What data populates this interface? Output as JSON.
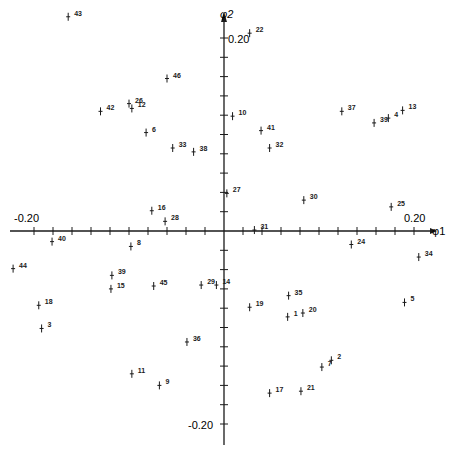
{
  "chart_data": {
    "type": "scatter",
    "title": "",
    "xlabel": "φ1",
    "ylabel": "φ2",
    "xlim": [
      -0.22,
      0.22
    ],
    "ylim": [
      -0.22,
      0.22
    ],
    "tick_step": 0.02,
    "tick_labels": {
      "x_neg": "-0.20",
      "x_pos": "0.20",
      "y_pos": "0.20",
      "y_neg": "-0.20"
    },
    "grid": false,
    "legend": null,
    "points": [
      {
        "label": "43",
        "x": -0.164,
        "y": 0.222
      },
      {
        "label": "22",
        "x": 0.027,
        "y": 0.205
      },
      {
        "label": "46",
        "x": -0.06,
        "y": 0.158
      },
      {
        "label": "26",
        "x": -0.1,
        "y": 0.132
      },
      {
        "label": "12",
        "x": -0.097,
        "y": 0.127
      },
      {
        "label": "42",
        "x": -0.13,
        "y": 0.124
      },
      {
        "label": "6",
        "x": -0.082,
        "y": 0.102
      },
      {
        "label": "33",
        "x": -0.054,
        "y": 0.086
      },
      {
        "label": "38",
        "x": -0.032,
        "y": 0.082
      },
      {
        "label": "10",
        "x": 0.009,
        "y": 0.119
      },
      {
        "label": "41",
        "x": 0.039,
        "y": 0.104
      },
      {
        "label": "32",
        "x": 0.048,
        "y": 0.086
      },
      {
        "label": "37",
        "x": 0.124,
        "y": 0.124
      },
      {
        "label": "39",
        "x": 0.158,
        "y": 0.112
      },
      {
        "label": "4",
        "x": 0.173,
        "y": 0.117
      },
      {
        "label": "13",
        "x": 0.188,
        "y": 0.125
      },
      {
        "label": "27",
        "x": 0.003,
        "y": 0.039
      },
      {
        "label": "30",
        "x": 0.084,
        "y": 0.032
      },
      {
        "label": "25",
        "x": 0.176,
        "y": 0.025
      },
      {
        "label": "16",
        "x": -0.076,
        "y": 0.021
      },
      {
        "label": "28",
        "x": -0.062,
        "y": 0.01
      },
      {
        "label": "31",
        "x": 0.032,
        "y": 0.001
      },
      {
        "label": "40",
        "x": -0.181,
        "y": -0.011
      },
      {
        "label": "8",
        "x": -0.098,
        "y": -0.016
      },
      {
        "label": "24",
        "x": 0.134,
        "y": -0.014
      },
      {
        "label": "34",
        "x": 0.205,
        "y": -0.027
      },
      {
        "label": "44",
        "x": -0.222,
        "y": -0.039
      },
      {
        "label": "39",
        "x": -0.118,
        "y": -0.046
      },
      {
        "label": "15",
        "x": -0.119,
        "y": -0.06
      },
      {
        "label": "45",
        "x": -0.074,
        "y": -0.057
      },
      {
        "label": "29",
        "x": -0.024,
        "y": -0.056
      },
      {
        "label": "14",
        "x": -0.008,
        "y": -0.056
      },
      {
        "label": "19",
        "x": 0.027,
        "y": -0.079
      },
      {
        "label": "35",
        "x": 0.068,
        "y": -0.067
      },
      {
        "label": "1",
        "x": 0.067,
        "y": -0.089
      },
      {
        "label": "20",
        "x": 0.083,
        "y": -0.085
      },
      {
        "label": "5",
        "x": 0.19,
        "y": -0.074
      },
      {
        "label": "18",
        "x": -0.195,
        "y": -0.077
      },
      {
        "label": "3",
        "x": -0.192,
        "y": -0.101
      },
      {
        "label": "36",
        "x": -0.039,
        "y": -0.115
      },
      {
        "label": "2",
        "x": 0.113,
        "y": -0.134
      },
      {
        "label": "7",
        "x": 0.103,
        "y": -0.141
      },
      {
        "label": "11",
        "x": -0.097,
        "y": -0.148
      },
      {
        "label": "9",
        "x": -0.068,
        "y": -0.16
      },
      {
        "label": "17",
        "x": 0.048,
        "y": -0.168
      },
      {
        "label": "21",
        "x": 0.081,
        "y": -0.166
      }
    ]
  }
}
